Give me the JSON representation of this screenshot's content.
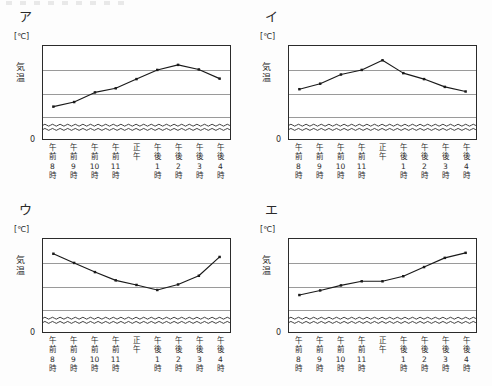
{
  "page": {
    "background_color": "#fdfdfd",
    "ink_color": "#2a2a2a",
    "gridline_color": "#9a9a9a"
  },
  "axis": {
    "unit_label": "[℃]",
    "y_title_chars": [
      "気",
      "温"
    ],
    "y_ticks": [
      "30",
      "25",
      "20",
      "15"
    ],
    "zero_tick": "0",
    "x_labels": [
      [
        "午",
        "前",
        "8",
        "時"
      ],
      [
        "午",
        "前",
        "9",
        "時"
      ],
      [
        "午",
        "前",
        "10",
        "時"
      ],
      [
        "午",
        "前",
        "11",
        "時"
      ],
      [
        "正",
        "午",
        "",
        ""
      ],
      [
        "午",
        "後",
        "1",
        "時"
      ],
      [
        "午",
        "後",
        "2",
        "時"
      ],
      [
        "午",
        "後",
        "3",
        "時"
      ],
      [
        "午",
        "後",
        "4",
        "時"
      ]
    ]
  },
  "panels": [
    {
      "label": "ア",
      "chart_ref": 0
    },
    {
      "label": "イ",
      "chart_ref": 1
    },
    {
      "label": "ウ",
      "chart_ref": 2
    },
    {
      "label": "エ",
      "chart_ref": 3
    }
  ],
  "chart_data": [
    {
      "type": "line",
      "title": "ア",
      "xlabel": "",
      "ylabel": "気温",
      "unit": "℃",
      "categories": [
        "午前8時",
        "午前9時",
        "午前10時",
        "午前11時",
        "正午",
        "午後1時",
        "午後2時",
        "午後3時",
        "午後4時"
      ],
      "values": [
        17.0,
        18.0,
        20.1,
        21.0,
        23.0,
        25.0,
        26.1,
        25.1,
        23.1
      ],
      "ylim": [
        0,
        30
      ],
      "y_ticks": [
        15,
        20,
        25,
        30
      ],
      "axis_break": {
        "from": 0,
        "to": 14,
        "style": "double-wave"
      },
      "grid": true,
      "legend": "none",
      "marker": "square"
    },
    {
      "type": "line",
      "title": "イ",
      "xlabel": "",
      "ylabel": "気温",
      "unit": "℃",
      "categories": [
        "午前8時",
        "午前9時",
        "午前10時",
        "午前11時",
        "正午",
        "午後1時",
        "午後2時",
        "午後3時",
        "午後4時"
      ],
      "values": [
        20.8,
        22.0,
        24.0,
        25.0,
        27.1,
        24.3,
        23.0,
        21.3,
        20.3
      ],
      "ylim": [
        0,
        30
      ],
      "y_ticks": [
        15,
        20,
        25,
        30
      ],
      "axis_break": {
        "from": 0,
        "to": 14,
        "style": "double-wave"
      },
      "grid": true,
      "legend": "none",
      "marker": "square"
    },
    {
      "type": "line",
      "title": "ウ",
      "xlabel": "",
      "ylabel": "気温",
      "unit": "℃",
      "categories": [
        "午前8時",
        "午前9時",
        "午前10時",
        "午前11時",
        "正午",
        "午後1時",
        "午後2時",
        "午後3時",
        "午後4時"
      ],
      "values": [
        27.0,
        25.0,
        23.0,
        21.2,
        20.2,
        19.1,
        20.3,
        22.2,
        26.3
      ],
      "ylim": [
        0,
        30
      ],
      "y_ticks": [
        15,
        20,
        25,
        30
      ],
      "axis_break": {
        "from": 0,
        "to": 14,
        "style": "double-wave"
      },
      "grid": true,
      "legend": "none",
      "marker": "square"
    },
    {
      "type": "line",
      "title": "エ",
      "xlabel": "",
      "ylabel": "気温",
      "unit": "℃",
      "categories": [
        "午前8時",
        "午前9時",
        "午前10時",
        "午前11時",
        "正午",
        "午後1時",
        "午後2時",
        "午後3時",
        "午後4時"
      ],
      "values": [
        18.0,
        19.0,
        20.1,
        21.0,
        21.0,
        22.1,
        24.1,
        26.1,
        27.2
      ],
      "ylim": [
        0,
        30
      ],
      "y_ticks": [
        15,
        20,
        25,
        30
      ],
      "axis_break": {
        "from": 0,
        "to": 14,
        "style": "double-wave"
      },
      "grid": true,
      "legend": "none",
      "marker": "square"
    }
  ]
}
